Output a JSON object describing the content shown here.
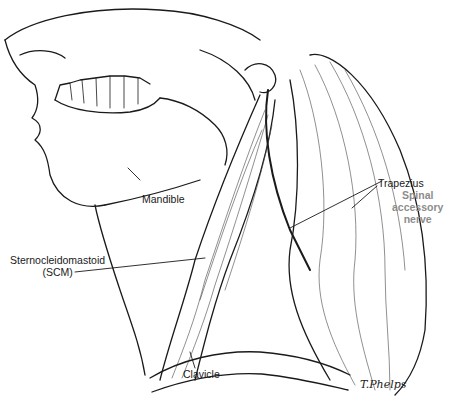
{
  "figure": {
    "type": "anatomical-illustration",
    "labels": {
      "mandible": "Mandible",
      "scm_line1": "Sternocleidomastoid",
      "scm_line2": "(SCM)",
      "clavicle": "Clavicle",
      "trapezius": "Trapezius",
      "spinal_line1": "Spinal",
      "spinal_line2": "accessory",
      "spinal_line3": "nerve"
    },
    "signature": "T.Phelps",
    "colors": {
      "ink": "#1a1a1a",
      "accent_label": "#8c8c8c",
      "background": "#ffffff"
    }
  }
}
